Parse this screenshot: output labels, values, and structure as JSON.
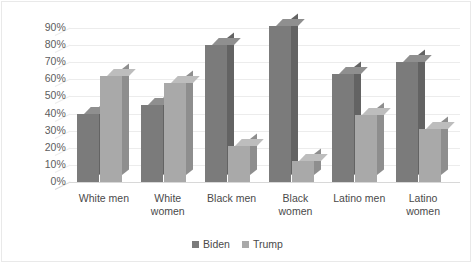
{
  "chart_data": {
    "type": "bar",
    "title": "",
    "subtitle": "",
    "xlabel": "",
    "ylabel": "",
    "ylim": [
      0,
      90
    ],
    "ytick_labels": [
      "90%",
      "80%",
      "70%",
      "60%",
      "50%",
      "40%",
      "30%",
      "20%",
      "10%",
      "0%"
    ],
    "ytick_values": [
      90,
      80,
      70,
      60,
      50,
      40,
      30,
      20,
      10,
      0
    ],
    "grid": true,
    "legend_position": "bottom",
    "style": "3d-clustered-column",
    "categories": [
      "White men",
      "White women",
      "Black men",
      "Black women",
      "Latino men",
      "Latino women"
    ],
    "series": [
      {
        "name": "Biden",
        "color": "#7b7b7b",
        "values": [
          40,
          45,
          80,
          91,
          63,
          70
        ]
      },
      {
        "name": "Trump",
        "color": "#a9a9a9",
        "values": [
          62,
          58,
          21,
          12,
          39,
          31
        ]
      }
    ]
  },
  "axis": {
    "ticks": [
      {
        "label": "90%",
        "value": 90
      },
      {
        "label": "80%",
        "value": 80
      },
      {
        "label": "70%",
        "value": 70
      },
      {
        "label": "60%",
        "value": 60
      },
      {
        "label": "50%",
        "value": 50
      },
      {
        "label": "40%",
        "value": 40
      },
      {
        "label": "30%",
        "value": 30
      },
      {
        "label": "20%",
        "value": 20
      },
      {
        "label": "10%",
        "value": 10
      },
      {
        "label": "0%",
        "value": 0
      }
    ]
  },
  "categories": [
    {
      "label": "White men"
    },
    {
      "label": "White\nwomen"
    },
    {
      "label": "Black men"
    },
    {
      "label": "Black\nwomen"
    },
    {
      "label": "Latino men"
    },
    {
      "label": "Latino\nwomen"
    }
  ],
  "legend": {
    "items": [
      {
        "label": "Biden",
        "color": "#7b7b7b"
      },
      {
        "label": "Trump",
        "color": "#a9a9a9"
      }
    ]
  }
}
